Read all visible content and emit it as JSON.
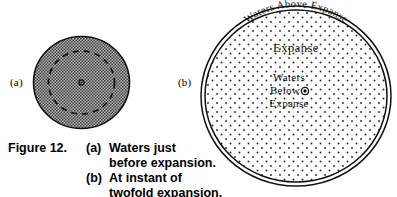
{
  "figure": {
    "number_label": "Figure 12.",
    "panels": [
      {
        "tag": "(a)",
        "caption": "Waters just\nbefore expansion.",
        "fill_style": "dense-gray-stipple",
        "inner_circle_style": "dashed",
        "center_marker": "small-dot"
      },
      {
        "tag": "(b)",
        "caption": "At instant of\ntwofold expansion.",
        "fill_style": "sparse-dot-stipple",
        "border_style": "double-line",
        "center_marker": "small-circle-dot",
        "labels": {
          "arc_top": "Waters Above Expanse",
          "middle": "Expanse",
          "center_line1": "Waters",
          "center_line2": "Below",
          "center_line3": "Expanse"
        }
      }
    ]
  },
  "colors": {
    "ink": "#000000",
    "paper": "#ffffff",
    "panel_a_fill": "#9a9a9a",
    "panel_b_fill": "#ffffff",
    "stipple_dot": "#2b2b2b"
  }
}
